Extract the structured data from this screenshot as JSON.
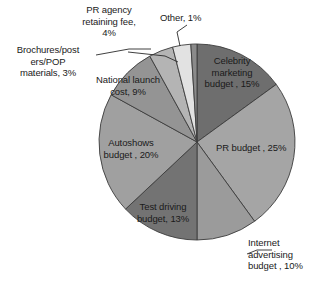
{
  "chart_data": {
    "type": "pie",
    "title": "",
    "subtitle": "",
    "xlabel": "",
    "ylabel": "",
    "legend_position": "none",
    "grid": false,
    "units": "percent",
    "total": 100,
    "categories": [
      "Celebrity marketing budget",
      "PR budget",
      "Internet advertising budget",
      "Test driving budget",
      "Autoshows budget",
      "National launch cost",
      "PR agency retaining fee",
      "Brochures/posters/POP materials",
      "Other"
    ],
    "values": [
      15,
      25,
      10,
      13,
      20,
      9,
      4,
      3,
      1
    ],
    "slices": [
      {
        "label": "Celebrity marketing budget , 15%",
        "label_lines": "Celebrity\nmarketing\nbudget , 15%",
        "name": "Celebrity marketing budget",
        "value": 15,
        "color": "#6e6e6e",
        "label_placement": "inside"
      },
      {
        "label": "PR budget , 25%",
        "label_lines": "PR budget , 25%",
        "name": "PR budget",
        "value": 25,
        "color": "#a5a5a5",
        "label_placement": "inside"
      },
      {
        "label": "Internet advertising budget , 10%",
        "label_lines": "Internet\nadvertising\nbudget , 10%",
        "name": "Internet advertising budget",
        "value": 10,
        "color": "#9b9b9b",
        "label_placement": "outside"
      },
      {
        "label": "Test driving budget, 13%",
        "label_lines": "Test driving\nbudget, 13%",
        "name": "Test driving budget",
        "value": 13,
        "color": "#737373",
        "label_placement": "inside"
      },
      {
        "label": "Autoshows budget , 20%",
        "label_lines": "Autoshows\nbudget , 20%",
        "name": "Autoshows budget",
        "value": 20,
        "color": "#a0a0a0",
        "label_placement": "inside"
      },
      {
        "label": "National launch cost, 9%",
        "label_lines": "National launch\ncost, 9%",
        "name": "National launch cost",
        "value": 9,
        "color": "#949494",
        "label_placement": "inside"
      },
      {
        "label": "PR agency retaining fee, 4%",
        "label_lines": "PR agency\nretaining fee,\n4%",
        "name": "PR agency retaining fee",
        "value": 4,
        "color": "#b4b4b4",
        "label_placement": "outside"
      },
      {
        "label": "Brochures/posters/POP materials, 3%",
        "label_lines": "Brochures/post\ners/POP\nmaterials, 3%",
        "name": "Brochures/posters/POP materials",
        "value": 3,
        "color": "#e2e2e2",
        "label_placement": "outside"
      },
      {
        "label": "Other, 1%",
        "label_lines": "Other, 1%",
        "name": "Other",
        "value": 1,
        "color": "#8a8a8a",
        "label_placement": "outside"
      }
    ],
    "geometry": {
      "center_x": 197,
      "center_y": 142,
      "radius": 98,
      "start_angle_deg": -90,
      "direction": "clockwise"
    },
    "style": {
      "slice_border_color": "#3c3c3c",
      "leader_line_color": "#2a2a2a",
      "background": "#ffffff"
    }
  }
}
